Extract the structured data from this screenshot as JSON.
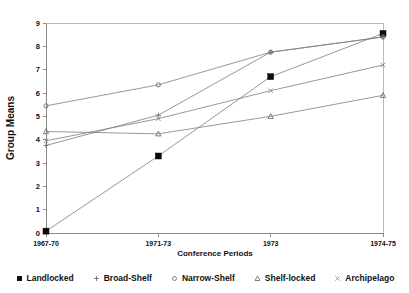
{
  "chart_data": {
    "type": "line",
    "title": "",
    "xlabel": "Conference Periods",
    "ylabel": "Group Means",
    "categories": [
      "1967-70",
      "1971-73",
      "1973",
      "1974-75"
    ],
    "ylim": [
      0,
      9
    ],
    "yticks": [
      0,
      1,
      2,
      3,
      4,
      5,
      6,
      7,
      8,
      9
    ],
    "ytick_labels": [
      "0",
      "1",
      "2",
      "3",
      "4",
      "5",
      "6",
      "7",
      "8",
      "9"
    ],
    "grid": false,
    "legend_position": "bottom",
    "series": [
      {
        "name": "Landlocked",
        "marker": "filled-square",
        "values": [
          0.08,
          3.3,
          6.7,
          8.55
        ]
      },
      {
        "name": "Broad-Shelf",
        "marker": "plus",
        "values": [
          3.75,
          5.05,
          7.75,
          8.4
        ]
      },
      {
        "name": "Narrow-Shelf",
        "marker": "circle",
        "values": [
          5.45,
          6.35,
          7.75,
          8.4
        ]
      },
      {
        "name": "Shelf-locked",
        "marker": "triangle",
        "values": [
          4.35,
          4.25,
          5.0,
          5.9
        ]
      },
      {
        "name": "Archipelago",
        "marker": "cross",
        "values": [
          3.95,
          4.9,
          6.1,
          7.2
        ]
      }
    ]
  },
  "axes": {
    "x_title": "Conference Periods",
    "y_title": "Group Means",
    "x_tick_labels": [
      "1967-70",
      "1971-73",
      "1973",
      "1974-75"
    ],
    "y_tick_labels": [
      "0",
      "1",
      "2",
      "3",
      "4",
      "5",
      "6",
      "7",
      "8",
      "9"
    ]
  },
  "legend": {
    "items": [
      {
        "label": "Landlocked",
        "marker": "filled-square-icon"
      },
      {
        "label": "Broad-Shelf",
        "marker": "plus-icon"
      },
      {
        "label": "Narrow-Shelf",
        "marker": "circle-icon"
      },
      {
        "label": "Shelf-locked",
        "marker": "triangle-icon"
      },
      {
        "label": "Archipelago",
        "marker": "cross-icon"
      }
    ]
  },
  "colors": {
    "line": "#7d7d7d",
    "axis": "#8a8a8a",
    "frame": "#b8b8b8",
    "text": "#111111",
    "background": "#ffffff"
  }
}
